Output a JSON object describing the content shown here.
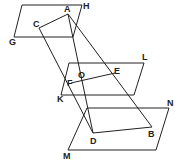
{
  "diagram": {
    "type": "geometry-three-parallel-planes",
    "planes": [
      {
        "name": "GH",
        "points": [
          [
            22,
            5
          ],
          [
            82,
            5
          ],
          [
            73,
            37
          ],
          [
            14,
            37
          ]
        ]
      },
      {
        "name": "KL",
        "points": [
          [
            69,
            63
          ],
          [
            144,
            63
          ],
          [
            134,
            95
          ],
          [
            61,
            95
          ]
        ]
      },
      {
        "name": "MN",
        "points": [
          [
            87,
            108
          ],
          [
            169,
            108
          ],
          [
            156,
            150
          ],
          [
            68,
            150
          ]
        ]
      }
    ],
    "segments": [
      {
        "from": "A",
        "to": "C"
      },
      {
        "from": "A",
        "to": "B"
      },
      {
        "from": "A",
        "to": "D"
      },
      {
        "from": "C",
        "to": "D"
      },
      {
        "from": "F",
        "to": "E"
      },
      {
        "from": "D",
        "to": "B"
      }
    ],
    "points": {
      "A": [
        68,
        14
      ],
      "C": [
        39,
        28
      ],
      "O": [
        80,
        77
      ],
      "E": [
        115,
        73
      ],
      "F": [
        71,
        83
      ],
      "D": [
        93,
        133
      ],
      "B": [
        152,
        127
      ]
    },
    "labels": [
      {
        "text": "A",
        "x": 64,
        "y": 12
      },
      {
        "text": "H",
        "x": 83,
        "y": 9
      },
      {
        "text": "C",
        "x": 33,
        "y": 27
      },
      {
        "text": "G",
        "x": 9,
        "y": 45
      },
      {
        "text": "L",
        "x": 142,
        "y": 60
      },
      {
        "text": "O",
        "x": 78,
        "y": 78
      },
      {
        "text": "E",
        "x": 114,
        "y": 74
      },
      {
        "text": "F",
        "x": 67,
        "y": 86
      },
      {
        "text": "K",
        "x": 57,
        "y": 102
      },
      {
        "text": "N",
        "x": 167,
        "y": 106
      },
      {
        "text": "B",
        "x": 148,
        "y": 137
      },
      {
        "text": "D",
        "x": 90,
        "y": 144
      },
      {
        "text": "M",
        "x": 63,
        "y": 159
      }
    ]
  }
}
